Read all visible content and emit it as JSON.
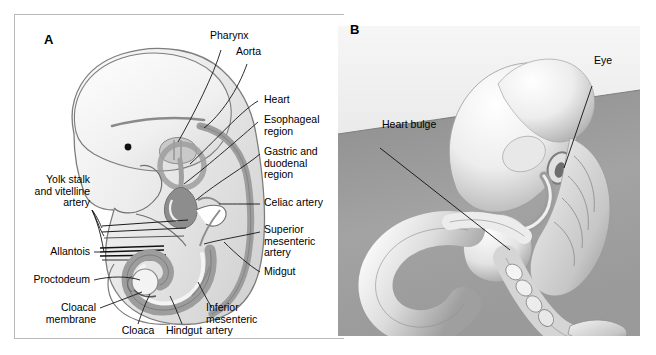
{
  "figure": {
    "background": "#ffffff",
    "border_color": "#b9b9b9"
  },
  "panels": [
    {
      "id": "A",
      "letter": "A",
      "type": "line-drawing",
      "description": "Sagittal schematic of a human embryo showing the primitive gut tube and its arteries",
      "labels": [
        {
          "name": "pharynx",
          "text": "Pharynx"
        },
        {
          "name": "aorta",
          "text": "Aorta"
        },
        {
          "name": "heart",
          "text": "Heart"
        },
        {
          "name": "esophageal-region",
          "text": "Esophageal\nregion"
        },
        {
          "name": "gastric-duodenal",
          "text": "Gastric and\nduodenal\nregion"
        },
        {
          "name": "celiac-artery",
          "text": "Celiac artery"
        },
        {
          "name": "superior-mesenteric",
          "text": "Superior\nmesenteric\nartery"
        },
        {
          "name": "midgut",
          "text": "Midgut"
        },
        {
          "name": "yolk-stalk-vitelline",
          "text": "Yolk stalk\nand vitelline\nartery"
        },
        {
          "name": "allantois",
          "text": "Allantois"
        },
        {
          "name": "proctodeum",
          "text": "Proctodeum"
        },
        {
          "name": "cloacal-membrane",
          "text": "Cloacal\nmembrane"
        },
        {
          "name": "cloaca",
          "text": "Cloaca"
        },
        {
          "name": "hindgut",
          "text": "Hindgut"
        },
        {
          "name": "inferior-mesenteric",
          "text": "Inferior\nmesenteric\nartery"
        }
      ],
      "colors": {
        "body_fill": "#ededed",
        "body_outline": "#7a7a7a",
        "gut_fill": "#9d9d9d",
        "gut_dark": "#7d7d7d",
        "leader_line": "#1a1a1a"
      }
    },
    {
      "id": "B",
      "letter": "B",
      "type": "photograph",
      "description": "Scanning-electron-micrograph style grayscale image of an embryo with a coiled gut loop",
      "labels": [
        {
          "name": "heart-bulge",
          "text": "Heart bulge"
        },
        {
          "name": "eye",
          "text": "Eye"
        }
      ],
      "colors": {
        "photo_background_dark": "#8c8c8c",
        "photo_background_light": "#d9d9d9",
        "specimen_light": "#f2f2f2",
        "specimen_shadow": "#9a9a9a"
      }
    }
  ]
}
